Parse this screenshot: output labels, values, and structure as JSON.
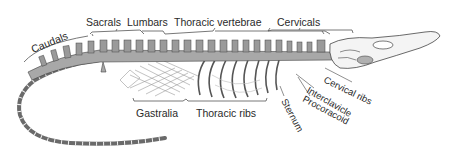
{
  "figure": {
    "colors": {
      "background": "#ffffff",
      "bone_fill": "#a8a8a8",
      "outline": "#444444",
      "label_text": "#2a2a2a"
    }
  },
  "labels": {
    "caudals": "Caudals",
    "sacrals": "Sacrals",
    "lumbars": "Lumbars",
    "thoracic_vertebrae": "Thoracic vertebrae",
    "cervicals": "Cervicals",
    "gastralia": "Gastralia",
    "thoracic_ribs": "Thoracic ribs",
    "sternum": "Sternum",
    "interclavicle": "Interclavicle",
    "procoracoid": "Procoracoid",
    "cervical_ribs": "Cervical ribs"
  }
}
